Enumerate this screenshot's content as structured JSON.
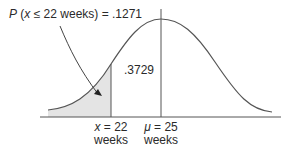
{
  "diagram": {
    "type": "normal-distribution",
    "probability_label": {
      "p": "P",
      "expr_open": " (",
      "var": "x",
      "expr_rest": " ≤ 22 weeks) = .1271"
    },
    "area_label": ".3729",
    "x_label": {
      "var": "x",
      "value": " = 22",
      "unit": "weeks"
    },
    "mu_label": {
      "var": "μ",
      "value": " = 25",
      "unit": "weeks"
    },
    "colors": {
      "line": "#555555",
      "shade": "#e4e4e4",
      "text": "#2a2a2a"
    }
  }
}
